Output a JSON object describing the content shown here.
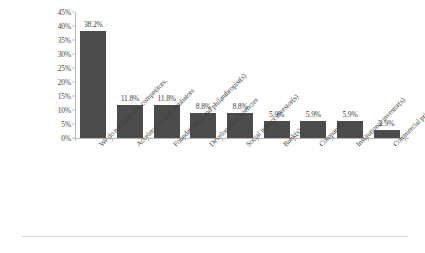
{
  "chart_data": {
    "type": "bar",
    "title": "",
    "subtitle": "",
    "xlabel": "",
    "ylabel": "",
    "ylim": [
      0,
      45
    ],
    "grid": false,
    "legend": "none",
    "orientation": "vertical",
    "bar_color": "#4c4c4c",
    "axis_color": "#b9b9b9",
    "value_label_suffix": "%",
    "categories": [
      "We do not have any competitors.",
      "Accelerators and incubators",
      "Foundation(s) and philanthropist(s)",
      "Development Agencies",
      "Social impact investor(s)",
      "Bank(s)",
      "Companies",
      "Institutional investor(s)",
      "Commercial private investors"
    ],
    "values": [
      38.2,
      11.8,
      11.8,
      8.8,
      8.8,
      5.9,
      5.9,
      5.9,
      2.9
    ],
    "value_labels": [
      "38.2%",
      "11.8%",
      "11.8%",
      "8.8%",
      "8.8%",
      "5.9%",
      "5.9%",
      "5.9%",
      "2.9%"
    ],
    "yticks": [
      0,
      5,
      10,
      15,
      20,
      25,
      30,
      35,
      40,
      45
    ],
    "ytick_labels": [
      "0%",
      "5%",
      "10%",
      "15%",
      "20%",
      "25%",
      "30%",
      "35%",
      "40%",
      "45%"
    ]
  }
}
